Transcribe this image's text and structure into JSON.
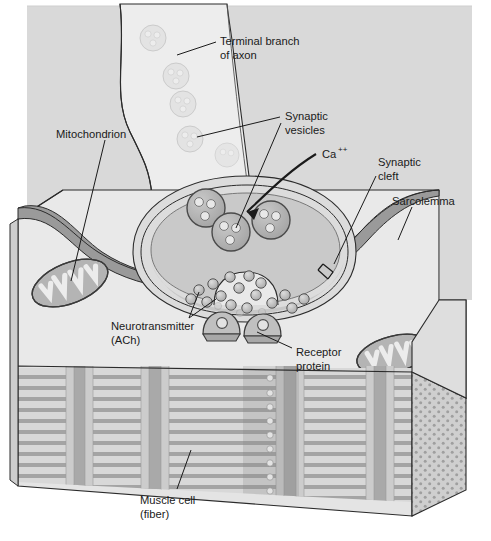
{
  "figure": {
    "domain": "anatomical-diagram",
    "width": 491,
    "height": 541,
    "background": "#ffffff"
  },
  "labels": [
    {
      "id": "terminal-branch-of-axon",
      "line1": "Terminal branch",
      "line2": "of axon",
      "x": 220,
      "y": 41,
      "leader": "M 213 44 L 177 56"
    },
    {
      "id": "synaptic-vesicles",
      "line1": "Synaptic",
      "line2": "vesicles",
      "x": 283,
      "y": 116,
      "leader_a": "M 278 119 L 196 138",
      "leader_b": "M 279 124 L 240 232"
    },
    {
      "id": "calcium-ion",
      "line1": "Ca",
      "line2": "",
      "superscript": "++",
      "x": 322,
      "y": 155,
      "leader": "M 316 154 L 300 152"
    },
    {
      "id": "synaptic-cleft",
      "line1": "Synaptic",
      "line2": "cleft",
      "x": 377,
      "y": 163,
      "leader": "M 375 177 L 336 262"
    },
    {
      "id": "sarcolemma",
      "line1": "Sarcolemma",
      "line2": "",
      "x": 392,
      "y": 201,
      "leader": "M 410 206 L 398 239"
    },
    {
      "id": "mitochondrion",
      "line1": "Mitochondrion",
      "line2": "",
      "x": 56,
      "y": 134,
      "leader": "M 103 139 L 71 280"
    },
    {
      "id": "neurotransmitter-ach",
      "line1": "Neurotransmitter",
      "line2": "(ACh)",
      "x": 111,
      "y": 326,
      "leader_a": "M 190 319 L 199 291",
      "leader_b": "M 190 319 L 215 297"
    },
    {
      "id": "receptor-protein",
      "line1": "Receptor",
      "line2": "protein",
      "x": 295,
      "y": 352,
      "leader": "M 291 349 L 256 330"
    },
    {
      "id": "muscle-cell-fiber",
      "line1": "Muscle cell",
      "line2": "(fiber)",
      "x": 140,
      "y": 500,
      "leader": "M 176 490 L 190 452"
    }
  ],
  "structures": {
    "axon_terminal": {
      "name": "synaptic-bouton",
      "vesicle_count_visible": 3,
      "fill": "#d2d2d2"
    },
    "axon_shaft": {
      "name": "terminal-branch-of-axon",
      "faint_vesicle_count": 5,
      "fill": "#ededed"
    },
    "sarcolemma_band": {
      "name": "sarcolemma",
      "fill": "#9a9a9a"
    },
    "muscle_block": {
      "name": "muscle-cell-fiber",
      "top_face_fill": "#e8e8e8",
      "striation_rows": 14,
      "myofibril_columns": 4,
      "cut_face_fill": "#cfcfcf",
      "cut_face_stipple": true
    },
    "mitochondria": [
      {
        "name": "mitochondrion-left",
        "cx": 70,
        "cy": 283
      },
      {
        "name": "mitochondrion-right",
        "cx": 394,
        "cy": 354
      }
    ],
    "receptor_proteins": [
      {
        "name": "receptor-protein-left",
        "cx": 220,
        "cy": 323
      },
      {
        "name": "receptor-protein-right",
        "cx": 260,
        "cy": 324
      }
    ],
    "neurotransmitter_dots": 16,
    "sarcomere_z_dots": 12
  },
  "palette": {
    "ink": "#1a1a1a",
    "outline": "#2b2b2b",
    "background_wall": "#d9d9d9",
    "top_face": "#e9e9e9",
    "bouton_fill": "#d2d2d2",
    "bouton_inner": "#c4c4c4",
    "axon_fill": "#ededed",
    "sarcolemma": "#9a9a9a",
    "vesicle_fill": "#b4b4b4",
    "vesicle_core": "#e4e4e4",
    "mito_fill": "#b0b0b0",
    "mito_crista": "#e6e6e6",
    "myofibril_light": "#dedede",
    "myofibril_dark": "#a8a8a8",
    "cut_face": "#cfcfcf",
    "transmitter": "#c2c2c2"
  }
}
